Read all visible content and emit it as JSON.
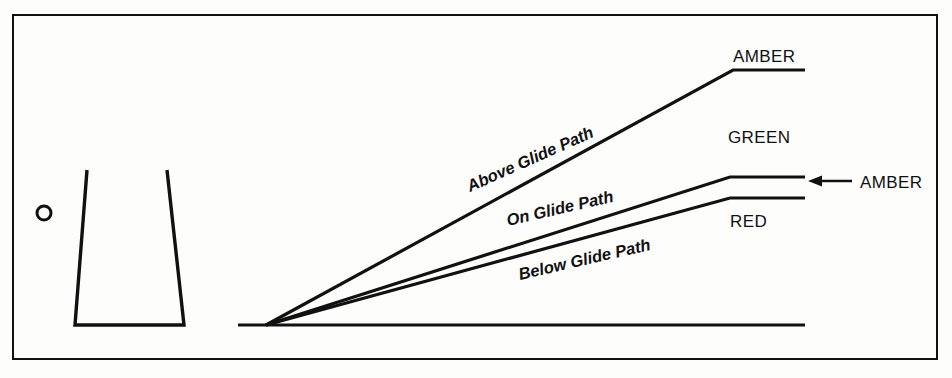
{
  "figure": {
    "background_color": "#fdfdfc",
    "ink_color": "#111111",
    "border": {
      "x": 12,
      "y": 14,
      "width": 926,
      "height": 346,
      "stroke_width": 2
    }
  },
  "runway": {
    "name": "runway-trapezoid",
    "top_left_x": 87,
    "top_right_x": 167,
    "bottom_left_x": 75,
    "bottom_right_x": 184,
    "top_y": 170,
    "bottom_y": 325
  },
  "marker": {
    "name": "light-unit-circle",
    "cx": 44,
    "cy": 213,
    "r": 7
  },
  "ground": {
    "name": "ground-line",
    "x1": 238,
    "x2": 805,
    "y": 325,
    "stroke_width": 3
  },
  "apex": {
    "x": 266,
    "y": 325
  },
  "beams": [
    {
      "id": "above-glide-path",
      "label": "Above Glide Path",
      "label_rotation": -24,
      "label_x": 470,
      "label_y": 192,
      "bend_x": 733,
      "bend_y": 70,
      "end_x": 805,
      "end_y": 70
    },
    {
      "id": "on-glide-path",
      "label": "On Glide Path",
      "label_rotation": -13,
      "label_x": 508,
      "label_y": 226,
      "bend_x": 730,
      "bend_y": 177,
      "end_x": 805,
      "end_y": 177
    },
    {
      "id": "below-glide-path",
      "label": "Below Glide Path",
      "label_rotation": -13,
      "label_x": 520,
      "label_y": 280,
      "bend_x": 730,
      "bend_y": 198,
      "end_x": 805,
      "end_y": 198
    }
  ],
  "zone_labels": [
    {
      "id": "amber-top",
      "text": "AMBER",
      "x": 733,
      "y": 62,
      "anchor": "start"
    },
    {
      "id": "green-middle",
      "text": "GREEN",
      "x": 728,
      "y": 143,
      "anchor": "start"
    },
    {
      "id": "red-bottom",
      "text": "RED",
      "x": 730,
      "y": 227,
      "anchor": "start"
    }
  ],
  "callout": {
    "id": "amber-callout",
    "text": "AMBER",
    "text_x": 860,
    "text_y": 188,
    "arrow_tail_x": 852,
    "arrow_head_x": 810,
    "arrow_y": 181
  }
}
